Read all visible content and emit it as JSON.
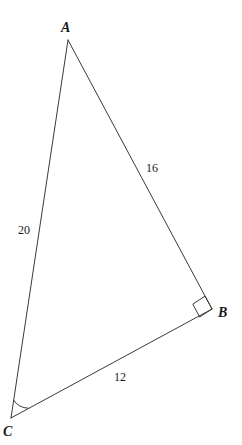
{
  "figure": {
    "kind": "geometry-diagram",
    "shape": "right-triangle",
    "background_color": "#ffffff",
    "stroke_color": "#3a3a3a",
    "text_color": "#1a1a1a"
  },
  "vertices": [
    {
      "id": "A",
      "label": "A",
      "x": 68,
      "y": 40,
      "label_x": 61,
      "label_y": 21
    },
    {
      "id": "B",
      "label": "B",
      "x": 212,
      "y": 309,
      "label_x": 218,
      "label_y": 306
    },
    {
      "id": "C",
      "label": "C",
      "x": 11,
      "y": 418,
      "label_x": 3,
      "label_y": 425
    }
  ],
  "sides": [
    {
      "id": "AB",
      "from": "A",
      "to": "B",
      "length_label": "16",
      "label_x": 146,
      "label_y": 162
    },
    {
      "id": "AC",
      "from": "A",
      "to": "C",
      "length_label": "20",
      "label_x": 18,
      "label_y": 224
    },
    {
      "id": "CB",
      "from": "C",
      "to": "B",
      "length_label": "12",
      "label_x": 114,
      "label_y": 371
    }
  ],
  "angle_marks": [
    {
      "id": "right-angle-B",
      "at": "B",
      "type": "right-angle-square",
      "size": 13
    },
    {
      "id": "angle-arc-C",
      "at": "C",
      "type": "arc",
      "radius": 18
    }
  ]
}
